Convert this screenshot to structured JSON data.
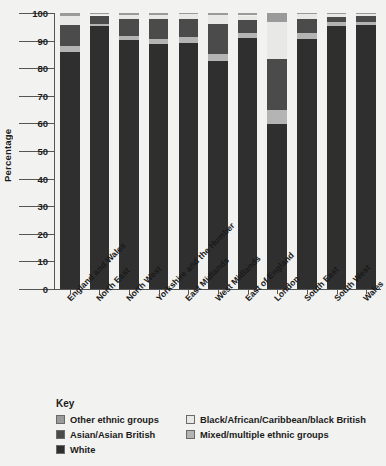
{
  "chart_data": {
    "type": "bar",
    "subtype": "stacked-bar-100",
    "title": "",
    "xlabel": "",
    "ylabel": "Percentage",
    "ylim": [
      0,
      100
    ],
    "ytick_step": 10,
    "yticks": [
      0,
      10,
      20,
      30,
      40,
      50,
      60,
      70,
      80,
      90,
      100
    ],
    "grid": false,
    "legend_position": "below",
    "legend_title": "Key",
    "categories": [
      "England and Wales",
      "North East",
      "North West",
      "Yorkshire and the Humber",
      "East Midlands",
      "West Midlands",
      "East of England",
      "London",
      "South East",
      "South West",
      "Wales"
    ],
    "series": [
      {
        "name": "White",
        "color": "#2f2f2f",
        "values": [
          86.0,
          95.3,
          90.2,
          88.8,
          89.3,
          82.7,
          90.8,
          59.8,
          90.7,
          95.4,
          95.6
        ]
      },
      {
        "name": "Mixed/multiple ethnic groups",
        "color": "#b4b4b4",
        "values": [
          2.2,
          0.9,
          1.6,
          1.7,
          1.9,
          2.4,
          2.0,
          5.0,
          2.0,
          1.4,
          1.0
        ]
      },
      {
        "name": "Asian/Asian British",
        "color": "#4b4b4b",
        "values": [
          7.5,
          2.9,
          6.2,
          7.3,
          6.5,
          10.8,
          4.8,
          18.5,
          5.2,
          1.9,
          2.3
        ]
      },
      {
        "name": "Black/African/Caribbean/black British",
        "color": "#e8e8e6",
        "values": [
          3.3,
          0.5,
          1.4,
          1.5,
          1.8,
          3.3,
          1.5,
          13.3,
          1.6,
          0.9,
          0.6
        ]
      },
      {
        "name": "Other ethnic groups",
        "color": "#9a9a9a",
        "values": [
          1.0,
          0.4,
          0.6,
          0.7,
          0.5,
          0.8,
          0.9,
          3.4,
          0.5,
          0.4,
          0.5
        ]
      }
    ]
  },
  "legend": {
    "title": "Key",
    "left_items": [
      {
        "label": "Other ethnic groups",
        "color": "#9a9a9a"
      },
      {
        "label": "Asian/Asian British",
        "color": "#4b4b4b"
      },
      {
        "label": "White",
        "color": "#2f2f2f"
      }
    ],
    "right_items": [
      {
        "label": "Black/African/Caribbean/black British",
        "color": "#e8e8e6"
      },
      {
        "label": "Mixed/multiple ethnic groups",
        "color": "#b4b4b4"
      }
    ]
  }
}
